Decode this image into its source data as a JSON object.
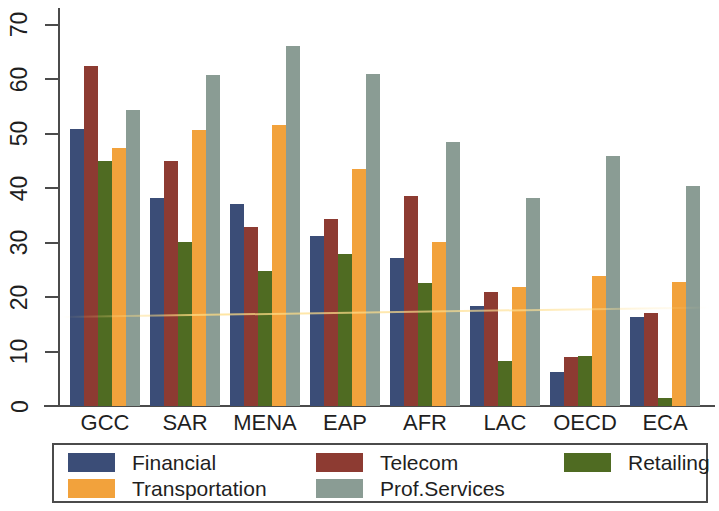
{
  "chart_data": {
    "type": "bar",
    "title": "",
    "subtitle": "",
    "xlabel": "",
    "ylabel": "",
    "ylim": [
      0,
      73
    ],
    "yticks": [
      0,
      10,
      20,
      30,
      40,
      50,
      60,
      70
    ],
    "grid": false,
    "legend_position": "bottom",
    "categories": [
      "GCC",
      "SAR",
      "MENA",
      "EAP",
      "AFR",
      "LAC",
      "OECD",
      "ECA"
    ],
    "series": [
      {
        "name": "Financial",
        "color": "#3b4d77",
        "values": [
          50.8,
          38.1,
          37.0,
          31.2,
          27.1,
          18.3,
          6.2,
          16.3
        ]
      },
      {
        "name": "Telecom",
        "color": "#8d3b32",
        "values": [
          62.3,
          45.0,
          32.9,
          34.4,
          38.6,
          20.9,
          9.0,
          17.0
        ]
      },
      {
        "name": "Retailing",
        "color": "#4e6ب22",
        "values": [
          44.9,
          30.1,
          24.8,
          27.9,
          22.6,
          8.2,
          9.2,
          1.5
        ]
      },
      {
        "name": "Transportation",
        "color": "#f2a23c",
        "values": [
          47.3,
          50.6,
          51.6,
          43.4,
          30.1,
          21.9,
          23.8,
          22.8
        ]
      },
      {
        "name": "Prof.Services",
        "color": "#8a9c94",
        "values": [
          54.4,
          60.8,
          66.0,
          61.0,
          48.5,
          38.1,
          45.9,
          40.4
        ]
      }
    ]
  },
  "legend": {
    "items": [
      {
        "label": "Financial",
        "color": "#3b4d77"
      },
      {
        "label": "Telecom",
        "color": "#8d3b32"
      },
      {
        "label": "Retailing",
        "color": "#4f6b22"
      },
      {
        "label": "Transportation",
        "color": "#f2a23c"
      },
      {
        "label": "Prof.Services",
        "color": "#8a9c94"
      }
    ]
  },
  "colors": {
    "financial": "#3b4d77",
    "telecom": "#8d3b32",
    "retailing": "#4f6b22",
    "transportation": "#f2a23c",
    "prof_services": "#8a9c94",
    "axis": "#4b4b4b",
    "text": "#1f1f1f",
    "background": "#ffffff"
  }
}
